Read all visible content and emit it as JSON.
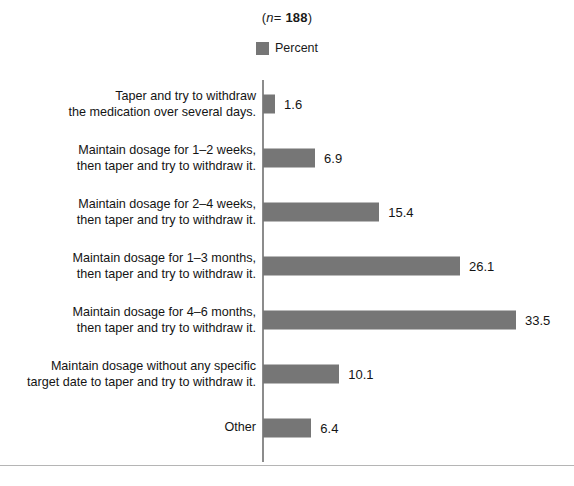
{
  "header": {
    "sample_prefix": "(",
    "sample_n": "n",
    "sample_eq": "= ",
    "sample_value": "188",
    "sample_suffix": ")",
    "sample_size_full": "(n= 188)"
  },
  "legend": {
    "swatch_name": "percent-swatch",
    "label": "Percent",
    "color": "#767676"
  },
  "chart_data": {
    "type": "bar",
    "orientation": "horizontal",
    "title": "(n= 188)",
    "xlabel": "",
    "ylabel": "",
    "legend": [
      "Percent"
    ],
    "legend_position": "top-center",
    "grid": false,
    "xlim": [
      0,
      33.5
    ],
    "categories": [
      "Taper and try to withdraw\nthe medication over several days.",
      "Maintain dosage for 1–2 weeks,\nthen taper and try to withdraw it.",
      "Maintain dosage for 2–4 weeks,\nthen taper and try to withdraw it.",
      "Maintain dosage for 1–3 months,\nthen taper and try to withdraw it.",
      "Maintain dosage for 4–6 months,\nthen taper and try to withdraw it.",
      "Maintain dosage without any specific\ntarget date to taper and try to withdraw it.",
      "Other"
    ],
    "values": [
      1.6,
      6.9,
      15.4,
      26.1,
      33.5,
      10.1,
      6.4
    ],
    "value_labels": [
      "1.6",
      "6.9",
      "15.4",
      "26.1",
      "33.5",
      "10.1",
      "6.4"
    ],
    "series": [
      {
        "name": "Percent",
        "color": "#767676",
        "values": [
          1.6,
          6.9,
          15.4,
          26.1,
          33.5,
          10.1,
          6.4
        ]
      }
    ]
  },
  "style": {
    "bar_color": "#767676",
    "axis_color": "#8c8c8c",
    "text_color": "#141414",
    "rule_color": "#b5b5b5",
    "background": "#ffffff"
  }
}
